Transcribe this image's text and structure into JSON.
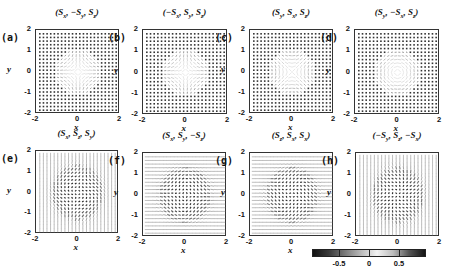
{
  "figure": {
    "panels": [
      {
        "id": "a",
        "label": "(a)",
        "title": "(Sₓ, −Sᵧ, Sₓ)",
        "title_parts": [
          "(",
          "S",
          "x",
          ", −",
          "S",
          "y",
          ", ",
          "S",
          "z",
          ")"
        ],
        "field": "hedgehog_out",
        "dots": true,
        "left": 35,
        "top": 29,
        "size": 84
      },
      {
        "id": "b",
        "label": "(b)",
        "title_parts": [
          "(−",
          "S",
          "x",
          ", ",
          "S",
          "y",
          ", ",
          "S",
          "z",
          ")"
        ],
        "field": "hedgehog_in",
        "dots": true,
        "left": 142,
        "top": 29,
        "size": 85
      },
      {
        "id": "c",
        "label": "(c)",
        "title_parts": [
          "(",
          "S",
          "y",
          ", ",
          "S",
          "x",
          ", ",
          "S",
          "z",
          ")"
        ],
        "field": "vortex",
        "dots": true,
        "left": 249,
        "top": 29,
        "size": 84
      },
      {
        "id": "d",
        "label": "(d)",
        "title_parts": [
          "(",
          "S",
          "y",
          ", −",
          "S",
          "x",
          ", ",
          "S",
          "z",
          ")"
        ],
        "field": "antivortex",
        "dots": true,
        "left": 354,
        "top": 29,
        "size": 85
      },
      {
        "id": "e",
        "label": "(e)",
        "title_parts": [
          "(",
          "S",
          "x",
          ", ",
          "S",
          "z",
          ", ",
          "S",
          "y",
          ")"
        ],
        "field": "vertical",
        "dots": false,
        "left": 35,
        "top": 150,
        "size": 83
      },
      {
        "id": "f",
        "label": "(f)",
        "title_parts": [
          "(",
          "S",
          "x",
          ", ",
          "S",
          "y",
          ", −",
          "S",
          "z",
          ")"
        ],
        "field": "horizontal",
        "dots": false,
        "left": 142,
        "top": 152,
        "size": 84
      },
      {
        "id": "g",
        "label": "(g)",
        "title_parts": [
          "(",
          "S",
          "z",
          ", ",
          "S",
          "x",
          ", ",
          "S",
          "x",
          ")"
        ],
        "field": "horizontal2",
        "dots": false,
        "left": 249,
        "top": 152,
        "size": 84
      },
      {
        "id": "h",
        "label": "(h)",
        "title_parts": [
          "(−",
          "S",
          "y",
          ", ",
          "S",
          "z",
          ", −",
          "S",
          "x",
          ")"
        ],
        "field": "vertical2",
        "dots": false,
        "left": 355,
        "top": 152,
        "size": 84
      }
    ],
    "axes": {
      "xlabel": "x",
      "ylabel": "y",
      "xticks": [
        "-2",
        "0",
        "2"
      ],
      "yticks": [
        "2",
        "1",
        "0",
        "-1",
        "-2"
      ],
      "range": [
        -2,
        2
      ]
    },
    "colorbar": {
      "ticks": [
        "-0.5",
        "0",
        "0.5"
      ],
      "tick_values": [
        -0.5,
        0,
        0.5
      ],
      "range": [
        -0.95,
        0.95
      ],
      "stops": [
        "#111111",
        "#3a3a3a",
        "#7a7a7a",
        "#b8b8b8",
        "#f2f2f2",
        "#bdbdbd",
        "#555555",
        "#141414"
      ]
    }
  },
  "chart_data": {
    "type": "heatmap",
    "panels": [
      {
        "label": "(a)",
        "title": "(Sx, -Sy, Sz)",
        "pattern": "radial outward (hedgehog) skyrmion"
      },
      {
        "label": "(b)",
        "title": "(-Sx, Sy, Sz)",
        "pattern": "radial inward (hedgehog) skyrmion"
      },
      {
        "label": "(c)",
        "title": "(Sy, Sx, Sz)",
        "pattern": "vortex-like"
      },
      {
        "label": "(d)",
        "title": "(Sy, -Sx, Sz)",
        "pattern": "antivortex-like"
      },
      {
        "label": "(e)",
        "title": "(Sx, Sz, Sy)",
        "pattern": "in-plane vertical background"
      },
      {
        "label": "(f)",
        "title": "(Sx, Sy, -Sz)",
        "pattern": "in-plane horizontal background"
      },
      {
        "label": "(g)",
        "title": "(Sz, Sx, Sx)",
        "pattern": "in-plane horizontal background"
      },
      {
        "label": "(h)",
        "title": "(-Sy, Sz, -Sx)",
        "pattern": "in-plane vertical background"
      }
    ],
    "xlabel": "x",
    "ylabel": "y",
    "xlim": [
      -2,
      2
    ],
    "ylim": [
      -2,
      2
    ],
    "xticks": [
      -2,
      0,
      2
    ],
    "yticks": [
      -2,
      -1,
      0,
      1,
      2
    ],
    "colorbar": {
      "ticks": [
        -0.5,
        0,
        0.5
      ],
      "range": [
        -1,
        1
      ]
    },
    "grid": false
  }
}
